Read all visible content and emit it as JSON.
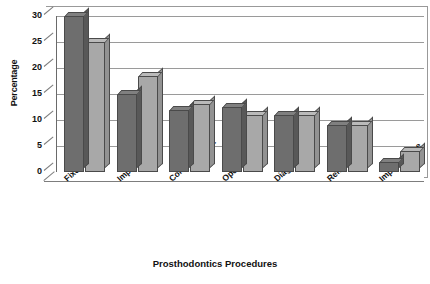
{
  "chart_data": {
    "type": "bar",
    "title": "",
    "xlabel": "Prosthodontics Procedures",
    "ylabel": "Percentage",
    "categories": [
      "Fixed",
      "Implant Rest",
      "Complete Dent",
      "Operative",
      "Diagnosis",
      "Removable",
      "Implant place"
    ],
    "series": [
      {
        "name": "series-1",
        "color": "#6e6e6e",
        "values": [
          30,
          15,
          12,
          12.5,
          11,
          9,
          2
        ]
      },
      {
        "name": "series-2",
        "color": "#a8a8a8",
        "values": [
          25,
          18.5,
          13,
          11,
          11,
          9,
          4
        ]
      }
    ],
    "ylim": [
      0,
      30
    ],
    "yticks": [
      0,
      5,
      10,
      15,
      20,
      25,
      30
    ],
    "ytick_labels": [
      "0",
      "5",
      "10",
      "15",
      "20",
      "25",
      "30"
    ],
    "grid": "horizontal",
    "legend": "none",
    "style": "3d-clustered-column"
  },
  "axes": {
    "y_title": "Percentage",
    "x_title": "Prosthodontics Procedures"
  }
}
